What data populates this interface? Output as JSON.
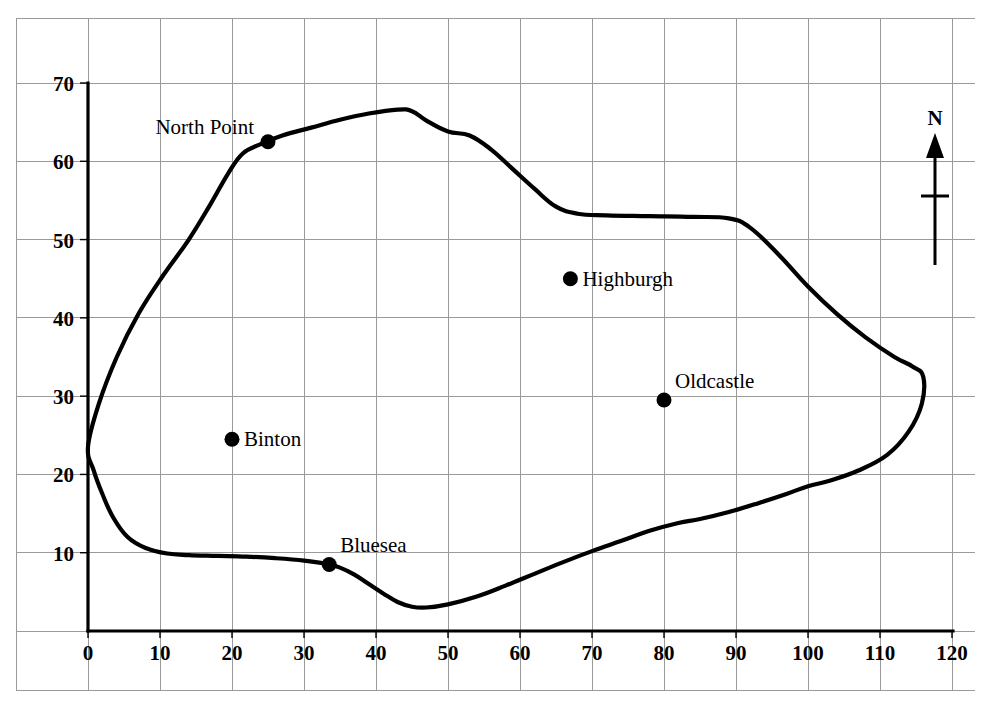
{
  "chart_data": {
    "type": "line",
    "title": "",
    "xlabel": "",
    "ylabel": "",
    "xlim": [
      0,
      120
    ],
    "ylim": [
      0,
      70
    ],
    "grid": true,
    "legend": null,
    "x_ticks": [
      0,
      10,
      20,
      30,
      40,
      50,
      60,
      70,
      80,
      90,
      100,
      110,
      120
    ],
    "y_ticks": [
      10,
      20,
      30,
      40,
      50,
      60,
      70
    ],
    "x_tick_labels": [
      "0",
      "10",
      "20",
      "30",
      "40",
      "50",
      "60",
      "70",
      "80",
      "90",
      "100",
      "110",
      "120"
    ],
    "y_tick_labels": [
      "10",
      "20",
      "30",
      "40",
      "50",
      "60",
      "70"
    ],
    "series": [
      {
        "name": "coastline",
        "closed": true,
        "points": [
          [
            0,
            23.5
          ],
          [
            1.5,
            29
          ],
          [
            4,
            35
          ],
          [
            7,
            40.5
          ],
          [
            10.5,
            45.5
          ],
          [
            14,
            50
          ],
          [
            17,
            54.5
          ],
          [
            19.5,
            58.5
          ],
          [
            21.5,
            61
          ],
          [
            24,
            62.2
          ],
          [
            27,
            63.3
          ],
          [
            31,
            64.3
          ],
          [
            35,
            65.3
          ],
          [
            39,
            66.1
          ],
          [
            43,
            66.6
          ],
          [
            45,
            66.4
          ],
          [
            47,
            65.2
          ],
          [
            50,
            63.8
          ],
          [
            53,
            63.3
          ],
          [
            56,
            61.5
          ],
          [
            59,
            59
          ],
          [
            62,
            56.5
          ],
          [
            65,
            54.2
          ],
          [
            68,
            53.3
          ],
          [
            72,
            53.1
          ],
          [
            78,
            53.0
          ],
          [
            84,
            52.9
          ],
          [
            89,
            52.7
          ],
          [
            92,
            51.5
          ],
          [
            96,
            48
          ],
          [
            100,
            44
          ],
          [
            104,
            40.5
          ],
          [
            108,
            37.5
          ],
          [
            112,
            35
          ],
          [
            114.5,
            33.8
          ],
          [
            116,
            32.5
          ],
          [
            115.8,
            29
          ],
          [
            114,
            25.5
          ],
          [
            111,
            22.5
          ],
          [
            107,
            20.5
          ],
          [
            103,
            19.2
          ],
          [
            100,
            18.5
          ],
          [
            97,
            17.5
          ],
          [
            93,
            16.3
          ],
          [
            89,
            15.2
          ],
          [
            85,
            14.3
          ],
          [
            82,
            13.8
          ],
          [
            78,
            12.8
          ],
          [
            74,
            11.5
          ],
          [
            70,
            10.2
          ],
          [
            66,
            8.8
          ],
          [
            62,
            7.3
          ],
          [
            58,
            5.8
          ],
          [
            54,
            4.4
          ],
          [
            50,
            3.4
          ],
          [
            47,
            3.0
          ],
          [
            45,
            3.1
          ],
          [
            43,
            3.7
          ],
          [
            41,
            4.8
          ],
          [
            39,
            6.0
          ],
          [
            37,
            7.2
          ],
          [
            35,
            8.1
          ],
          [
            33,
            8.6
          ],
          [
            30,
            9.0
          ],
          [
            26,
            9.3
          ],
          [
            22,
            9.5
          ],
          [
            18,
            9.6
          ],
          [
            14,
            9.7
          ],
          [
            11,
            9.9
          ],
          [
            8,
            10.6
          ],
          [
            5.5,
            12
          ],
          [
            3.5,
            14.5
          ],
          [
            2,
            17.5
          ],
          [
            0.8,
            20.5
          ],
          [
            0,
            23.5
          ]
        ]
      }
    ],
    "cities": [
      {
        "name": "North Point",
        "x": 25,
        "y": 62.5,
        "label_position": "left"
      },
      {
        "name": "Binton",
        "x": 20,
        "y": 24.5,
        "label_position": "right"
      },
      {
        "name": "Highburgh",
        "x": 67,
        "y": 45,
        "label_position": "right"
      },
      {
        "name": "Oldcastle",
        "x": 80,
        "y": 29.5,
        "label_position": "upper-right"
      },
      {
        "name": "Bluesea",
        "x": 33.5,
        "y": 8.5,
        "label_position": "upper-right"
      }
    ],
    "compass": {
      "label": "N",
      "direction": "north"
    }
  },
  "colors": {
    "coastline": "#000000",
    "grid": "#9a9a9a",
    "axis": "#000000",
    "city_marker": "#000000",
    "background": "#ffffff"
  }
}
